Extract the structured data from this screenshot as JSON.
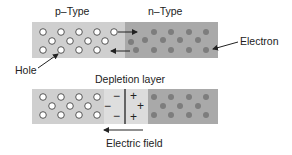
{
  "labels": {
    "p_type": "p–Type",
    "n_type": "n–Type",
    "electron": "Electron",
    "hole": "Hole",
    "depletion_layer": "Depletion layer",
    "electric_field": "Electric field"
  },
  "signs": {
    "neg": "−",
    "pos": "+"
  },
  "colors": {
    "p_region": "#cfcfcf",
    "n_region": "#a9a9a9",
    "depletion_p": "#dedede",
    "depletion_n": "#dcdcdc",
    "electron": "#7d7d7d",
    "hole_fill": "#ffffff",
    "hole_stroke": "#555555",
    "line": "#222222"
  }
}
